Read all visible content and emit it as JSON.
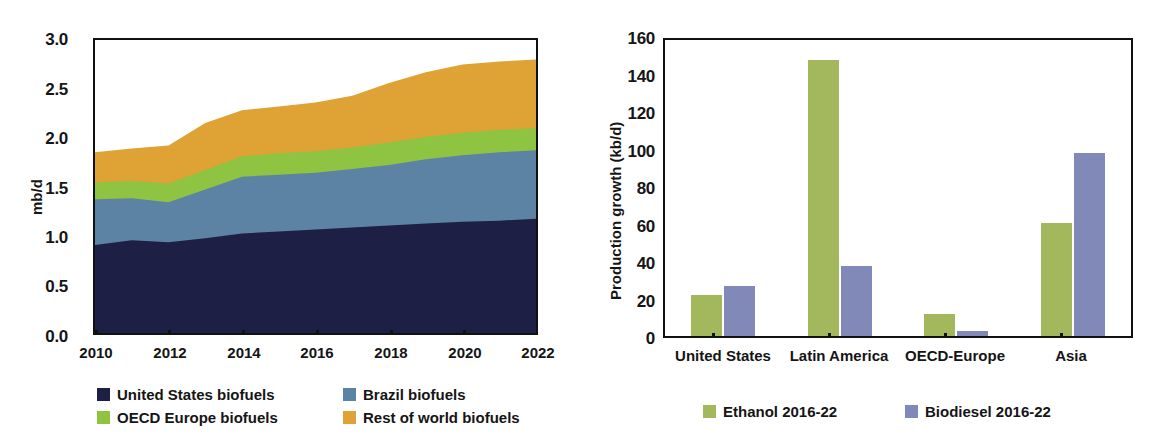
{
  "figure": {
    "title_fragment": ""
  },
  "left_chart": {
    "ylabel": "mb/d",
    "y_ticks": [
      "0.0",
      "0.5",
      "1.0",
      "1.5",
      "2.0",
      "2.5",
      "3.0"
    ],
    "x_ticks": [
      "2010",
      "2012",
      "2014",
      "2016",
      "2018",
      "2020",
      "2022"
    ],
    "legend": [
      {
        "label": "United States biofuels",
        "color": "#1d2044"
      },
      {
        "label": "Brazil biofuels",
        "color": "#5c83a4"
      },
      {
        "label": "OECD Europe biofuels",
        "color": "#8fc342"
      },
      {
        "label": "Rest of world biofuels",
        "color": "#dfa235"
      }
    ]
  },
  "right_chart": {
    "ylabel": "Production growth (kb/d)",
    "y_ticks": [
      "0",
      "20",
      "40",
      "60",
      "80",
      "100",
      "120",
      "140",
      "160"
    ],
    "x_ticks": [
      "United States",
      "Latin America",
      "OECD-Europe",
      "Asia"
    ],
    "legend": [
      {
        "label": "Ethanol 2016-22",
        "color": "#a3b85c"
      },
      {
        "label": "Biodiesel 2016-22",
        "color": "#8189b8"
      }
    ]
  },
  "chart_data": [
    {
      "type": "area",
      "stacked": true,
      "title": "Biofuels supply",
      "xlabel": "",
      "ylabel": "mb/d",
      "xlim": [
        2010,
        2022
      ],
      "ylim": [
        0.0,
        3.0
      ],
      "yticks": [
        0.0,
        0.5,
        1.0,
        1.5,
        2.0,
        2.5,
        3.0
      ],
      "xticks": [
        2010,
        2012,
        2014,
        2016,
        2018,
        2020,
        2022
      ],
      "gridlines_y": [
        2.0,
        2.5
      ],
      "grid": "dashed-partial",
      "legend_position": "below",
      "x": [
        2010,
        2011,
        2012,
        2013,
        2014,
        2015,
        2016,
        2017,
        2018,
        2019,
        2020,
        2021,
        2022
      ],
      "series": [
        {
          "name": "United States biofuels",
          "color": "#1d2044",
          "values": [
            0.9,
            0.95,
            0.93,
            0.97,
            1.02,
            1.04,
            1.06,
            1.08,
            1.1,
            1.12,
            1.14,
            1.15,
            1.17
          ]
        },
        {
          "name": "Brazil biofuels",
          "color": "#5c83a4",
          "values": [
            0.47,
            0.43,
            0.41,
            0.5,
            0.58,
            0.58,
            0.58,
            0.6,
            0.62,
            0.66,
            0.68,
            0.7,
            0.7
          ]
        },
        {
          "name": "OECD Europe biofuels",
          "color": "#8fc342",
          "values": [
            0.17,
            0.18,
            0.19,
            0.2,
            0.21,
            0.22,
            0.22,
            0.22,
            0.23,
            0.23,
            0.23,
            0.23,
            0.23
          ]
        },
        {
          "name": "Rest of world biofuels",
          "color": "#dfa235",
          "values": [
            0.31,
            0.33,
            0.39,
            0.48,
            0.47,
            0.48,
            0.5,
            0.53,
            0.61,
            0.66,
            0.7,
            0.7,
            0.7
          ]
        }
      ],
      "stack_tops": {
        "United States biofuels": [
          0.9,
          0.95,
          0.93,
          0.97,
          1.02,
          1.04,
          1.06,
          1.08,
          1.1,
          1.12,
          1.14,
          1.15,
          1.17
        ],
        "Brazil biofuels": [
          1.37,
          1.38,
          1.34,
          1.47,
          1.6,
          1.62,
          1.64,
          1.68,
          1.72,
          1.78,
          1.82,
          1.85,
          1.87
        ],
        "OECD Europe biofuels": [
          1.54,
          1.56,
          1.53,
          1.67,
          1.81,
          1.84,
          1.86,
          1.9,
          1.95,
          2.01,
          2.05,
          2.08,
          2.1
        ],
        "Rest of world biofuels": [
          1.85,
          1.89,
          1.92,
          2.15,
          2.28,
          2.32,
          2.36,
          2.43,
          2.56,
          2.67,
          2.75,
          2.78,
          2.8
        ]
      }
    },
    {
      "type": "bar",
      "title": "Biofuels production growth by region",
      "xlabel": "",
      "ylabel": "Production growth (kb/d)",
      "ylim": [
        0,
        160
      ],
      "yticks": [
        0,
        20,
        40,
        60,
        80,
        100,
        120,
        140,
        160
      ],
      "gridlines_y": [
        20,
        40,
        60,
        80,
        100,
        120,
        140
      ],
      "grid": "dashed-horizontal",
      "legend_position": "below",
      "categories": [
        "United States",
        "Latin America",
        "OECD-Europe",
        "Asia"
      ],
      "series": [
        {
          "name": "Ethanol 2016-22",
          "color": "#a3b85c",
          "values": [
            22,
            149,
            12,
            61
          ]
        },
        {
          "name": "Biodiesel 2016-22",
          "color": "#8189b8",
          "values": [
            27,
            38,
            3,
            99
          ]
        }
      ]
    }
  ]
}
